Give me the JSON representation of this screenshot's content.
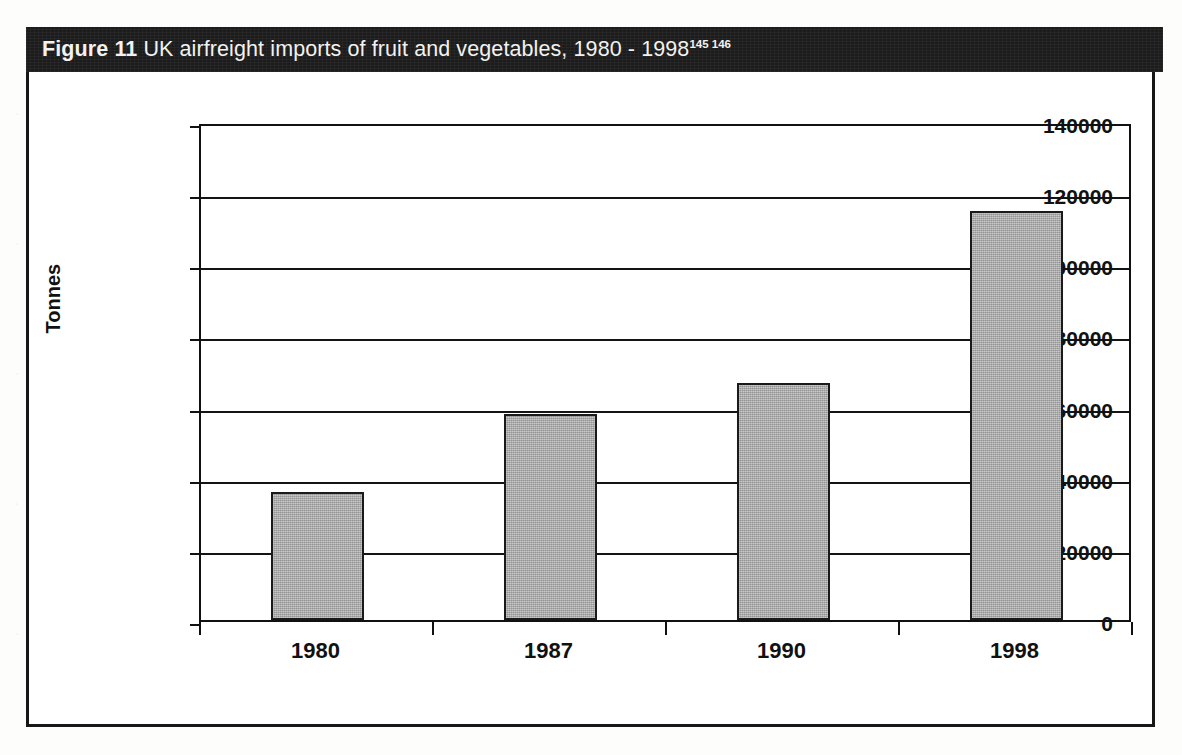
{
  "figure": {
    "label": "Figure",
    "number": "11",
    "caption": "UK airfreight imports of fruit and vegetables, 1980 - 1998",
    "footnote_refs": "145 146",
    "banner_color": "#1c1c1c",
    "banner_text_color": "#f2f2f0"
  },
  "chart_data": {
    "type": "bar",
    "title": "UK airfreight imports of fruit and vegetables, 1980 - 1998",
    "categories": [
      "1980",
      "1987",
      "1990",
      "1998"
    ],
    "values": [
      36000,
      58000,
      66500,
      115000
    ],
    "xlabel": "",
    "ylabel": "Tonnes",
    "ylim": [
      0,
      140000
    ],
    "ytick_labels": [
      "140000",
      "120000",
      "100000",
      "80000",
      "60000",
      "40000",
      "20000",
      "0"
    ],
    "ytick_values": [
      140000,
      120000,
      100000,
      80000,
      60000,
      40000,
      20000,
      0
    ],
    "ytick_step": 20000,
    "grid": true,
    "legend": false,
    "bar_fill_color": "#a9a9a9",
    "bar_edge_color": "#1a1a1a",
    "axis_color": "#111111",
    "plot_background": "#ffffff"
  }
}
